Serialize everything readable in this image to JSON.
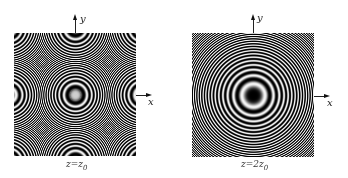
{
  "figure": {
    "panels": [
      {
        "id": "left",
        "caption_var": "z",
        "caption_eq": "=",
        "caption_coef": "",
        "caption_base": "z",
        "caption_sub": "0",
        "x_axis_label": "x",
        "y_axis_label": "y",
        "center_intensity": "bright",
        "ring_scale": 1.0
      },
      {
        "id": "right",
        "caption_var": "z",
        "caption_eq": "=",
        "caption_coef": "2",
        "caption_base": "z",
        "caption_sub": "0",
        "x_axis_label": "x",
        "y_axis_label": "y",
        "center_intensity": "dark",
        "ring_scale": 0.5
      }
    ],
    "colors": {
      "background": "#ffffff",
      "ring_dark": "#000000",
      "ring_light": "#f4f4f4",
      "axis": "#222222"
    }
  }
}
